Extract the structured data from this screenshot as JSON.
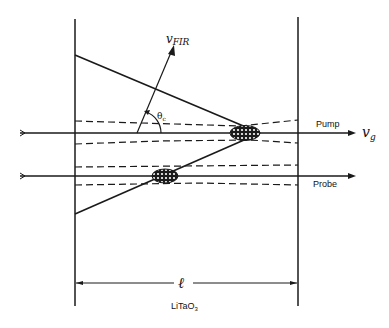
{
  "diagram": {
    "labels": {
      "v_fir_main": "v",
      "v_fir_sub": "FIR",
      "theta_main": "θ",
      "theta_sub": "c",
      "pump": "Pump",
      "probe": "Probe",
      "v_g_main": "v",
      "v_g_sub": "g",
      "length": "ℓ",
      "crystal_main": "LiTaO",
      "crystal_sub": "3"
    },
    "colors": {
      "stroke": "#1a1a1a",
      "background": "#ffffff"
    }
  }
}
